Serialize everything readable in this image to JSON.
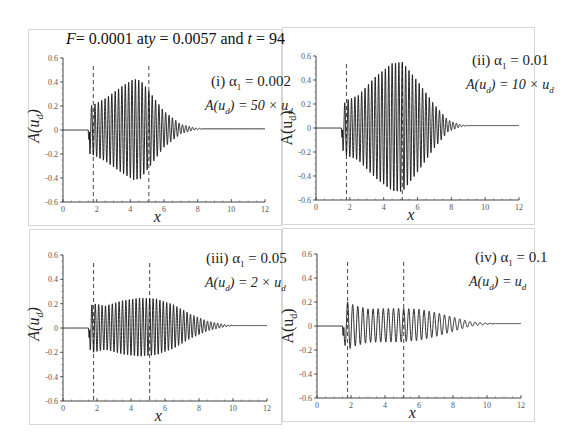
{
  "figure": {
    "title_parts": {
      "F": "F",
      "eq1": "= 0.0001 at",
      "y": "y",
      "eq2": " = 0.0057 and ",
      "t": "t",
      "eq3": " = 94"
    }
  },
  "chart_data": [
    {
      "id": "i",
      "type": "line",
      "label": "(i) α1 = 0.002",
      "label_roman": "(i)",
      "alpha1": "0.002",
      "scale_text": "A(ud) = 50 × ud",
      "scale_factor": "50 ×",
      "xlabel": "x",
      "ylabel": "A(ud)",
      "xlim": [
        0,
        12
      ],
      "ylim": [
        -0.6,
        0.6
      ],
      "xticks": [
        0,
        2,
        4,
        6,
        8,
        10,
        12
      ],
      "yticks": [
        0.6,
        0.4,
        0.2,
        0,
        -0.2,
        -0.4,
        -0.6
      ],
      "dashed_lines_x": [
        1.8,
        5.1
      ],
      "packet": {
        "onset": 1.5,
        "wavelength": 0.2,
        "envelope": [
          [
            1.5,
            0.0
          ],
          [
            1.6,
            0.2
          ],
          [
            1.8,
            0.21
          ],
          [
            2.5,
            0.26
          ],
          [
            3.5,
            0.36
          ],
          [
            4.2,
            0.42
          ],
          [
            4.6,
            0.41
          ],
          [
            5.1,
            0.32
          ],
          [
            6.0,
            0.15
          ],
          [
            7.0,
            0.04
          ],
          [
            7.8,
            0.01
          ],
          [
            8.3,
            0.0
          ]
        ],
        "tail_level": 0.01,
        "initial_dip": -0.08
      }
    },
    {
      "id": "ii",
      "type": "line",
      "label": "(ii) α1 = 0.01",
      "label_roman": "(ii)",
      "alpha1": "0.01",
      "scale_text": "A(ud) = 10 × ud",
      "scale_factor": "10 ×",
      "xlabel": "x",
      "ylabel": "A(ud)",
      "xlim": [
        0,
        12
      ],
      "ylim": [
        -0.6,
        0.6
      ],
      "xticks": [
        0,
        2,
        4,
        6,
        8,
        10,
        12
      ],
      "yticks": [
        0.6,
        0.4,
        0.2,
        0,
        -0.2,
        -0.4,
        -0.6
      ],
      "dashed_lines_x": [
        1.8,
        5.1
      ],
      "packet": {
        "onset": 1.5,
        "wavelength": 0.2,
        "envelope": [
          [
            1.5,
            0.0
          ],
          [
            1.6,
            0.19
          ],
          [
            1.8,
            0.23
          ],
          [
            2.5,
            0.27
          ],
          [
            3.5,
            0.42
          ],
          [
            4.5,
            0.53
          ],
          [
            5.1,
            0.54
          ],
          [
            6.0,
            0.38
          ],
          [
            7.0,
            0.18
          ],
          [
            7.8,
            0.05
          ],
          [
            8.5,
            0.01
          ],
          [
            9.0,
            0.0
          ]
        ],
        "tail_level": 0.02,
        "initial_dip": -0.08
      }
    },
    {
      "id": "iii",
      "type": "line",
      "label": "(iii) α1 = 0.05",
      "label_roman": "(iii)",
      "alpha1": "0.05",
      "scale_text": "A(ud) = 2 × ud",
      "scale_factor": "2 ×",
      "xlabel": "x",
      "ylabel": "A(ud)",
      "xlim": [
        0,
        12
      ],
      "ylim": [
        -0.6,
        0.6
      ],
      "xticks": [
        0,
        2,
        4,
        6,
        8,
        10,
        12
      ],
      "yticks": [
        0.6,
        0.4,
        0.2,
        0,
        -0.2,
        -0.4,
        -0.6
      ],
      "dashed_lines_x": [
        1.8,
        5.1
      ],
      "packet": {
        "onset": 1.5,
        "wavelength": 0.2,
        "envelope": [
          [
            1.5,
            0.0
          ],
          [
            1.6,
            0.18
          ],
          [
            1.8,
            0.2
          ],
          [
            2.5,
            0.18
          ],
          [
            3.5,
            0.22
          ],
          [
            4.5,
            0.24
          ],
          [
            5.5,
            0.23
          ],
          [
            6.5,
            0.18
          ],
          [
            7.5,
            0.1
          ],
          [
            8.5,
            0.04
          ],
          [
            9.5,
            0.01
          ],
          [
            10.0,
            0.0
          ]
        ],
        "tail_level": 0.02,
        "initial_dip": -0.08
      }
    },
    {
      "id": "iv",
      "type": "line",
      "label": "(iv) α1 = 0.1",
      "label_roman": "(iv)",
      "alpha1": "0.1",
      "scale_text": "A(ud) = ud",
      "scale_factor": "",
      "xlabel": "x",
      "ylabel": "A(ud)",
      "xlim": [
        0,
        12
      ],
      "ylim": [
        -0.6,
        0.6
      ],
      "xticks": [
        0,
        2,
        4,
        6,
        8,
        10,
        12
      ],
      "yticks": [
        0.6,
        0.4,
        0.2,
        0,
        -0.2,
        -0.4,
        -0.6
      ],
      "dashed_lines_x": [
        1.8,
        5.1
      ],
      "packet": {
        "onset": 1.5,
        "wavelength": 0.3,
        "envelope": [
          [
            1.5,
            0.0
          ],
          [
            1.6,
            0.15
          ],
          [
            1.8,
            0.2
          ],
          [
            2.2,
            0.17
          ],
          [
            3.0,
            0.14
          ],
          [
            4.0,
            0.14
          ],
          [
            5.0,
            0.14
          ],
          [
            6.0,
            0.13
          ],
          [
            7.0,
            0.1
          ],
          [
            8.0,
            0.06
          ],
          [
            9.0,
            0.02
          ],
          [
            10.0,
            0.005
          ],
          [
            10.5,
            0.0
          ]
        ],
        "tail_level": 0.02,
        "initial_dip": -0.08
      }
    }
  ],
  "layout": {
    "panels": [
      {
        "left": 28,
        "top": 29,
        "width": 254,
        "height": 197,
        "x0": 63,
        "x12": 265,
        "y06": 58,
        "ym06": 202
      },
      {
        "left": 282,
        "top": 27,
        "width": 253,
        "height": 198,
        "x0": 316,
        "x12": 519,
        "y06": 56,
        "ym06": 200
      },
      {
        "left": 29,
        "top": 229,
        "width": 253,
        "height": 196,
        "x0": 63,
        "x12": 267,
        "y06": 255,
        "ym06": 401
      },
      {
        "left": 282,
        "top": 228,
        "width": 253,
        "height": 194,
        "x0": 317,
        "x12": 521,
        "y06": 254,
        "ym06": 398
      }
    ],
    "line_color": "#111111",
    "dash_color": "#333333",
    "axis_color": "#444444"
  }
}
